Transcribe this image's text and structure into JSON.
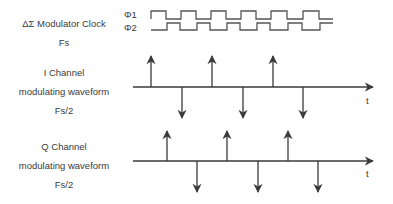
{
  "clock": {
    "title": "ΔΣ Modulator Clock",
    "freq": "Fs",
    "phi1": "Φ1",
    "phi2": "Φ2"
  },
  "i_channel": {
    "line1": "I Channel",
    "line2": "modulating waveform",
    "line3": "Fs/2",
    "axis_label": "t"
  },
  "q_channel": {
    "line1": "Q Channel",
    "line2": "modulating waveform",
    "line3": "Fs/2",
    "axis_label": "t"
  },
  "colors": {
    "stroke": "#3a3a3a",
    "background": "#ffffff"
  }
}
